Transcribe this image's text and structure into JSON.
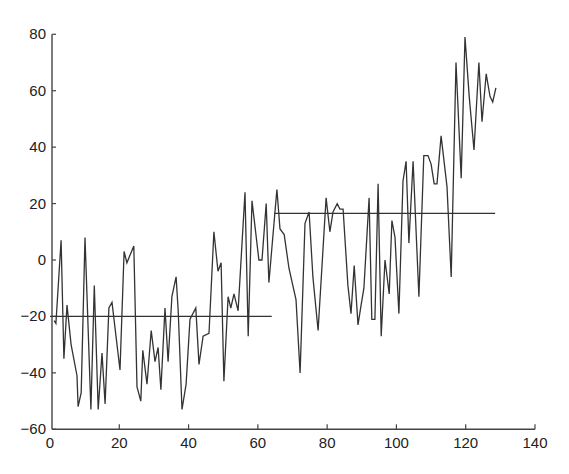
{
  "chart_data": {
    "type": "line",
    "title": "",
    "xlabel": "",
    "ylabel": "",
    "xlim": [
      0,
      140
    ],
    "ylim": [
      -60,
      80
    ],
    "x_ticks": [
      0,
      20,
      40,
      60,
      80,
      100,
      120,
      140
    ],
    "y_ticks": [
      -60,
      -40,
      -20,
      0,
      20,
      40,
      60,
      80
    ],
    "grid": false,
    "legend": null,
    "series": [
      {
        "name": "series",
        "color": "#333333",
        "points": [
          [
            1.2,
            -21.5
          ],
          [
            1.7,
            -22.5
          ],
          [
            3.2,
            7
          ],
          [
            4.0,
            -35
          ],
          [
            4.9,
            -16
          ],
          [
            6.1,
            -30
          ],
          [
            7.8,
            -41
          ],
          [
            8.1,
            -52
          ],
          [
            9.0,
            -47
          ],
          [
            10.1,
            8
          ],
          [
            11.8,
            -53
          ],
          [
            12.8,
            -9
          ],
          [
            13.9,
            -53
          ],
          [
            15.0,
            -33
          ],
          [
            15.9,
            -51
          ],
          [
            17.0,
            -17
          ],
          [
            17.9,
            -15
          ],
          [
            20.2,
            -39
          ],
          [
            21.4,
            3
          ],
          [
            22.2,
            -1
          ],
          [
            24.2,
            5
          ],
          [
            25.1,
            -45
          ],
          [
            26.2,
            -50
          ],
          [
            26.8,
            -32
          ],
          [
            28.0,
            -44
          ],
          [
            29.2,
            -25
          ],
          [
            30.3,
            -36
          ],
          [
            31.2,
            -31
          ],
          [
            32.0,
            -46
          ],
          [
            33.2,
            -17
          ],
          [
            34.1,
            -36
          ],
          [
            35.2,
            -13
          ],
          [
            36.4,
            -6
          ],
          [
            37.0,
            -18
          ],
          [
            38.1,
            -53
          ],
          [
            39.3,
            -44
          ],
          [
            40.4,
            -21
          ],
          [
            42.1,
            -17
          ],
          [
            43.0,
            -37
          ],
          [
            44.2,
            -27
          ],
          [
            45.9,
            -26
          ],
          [
            47.3,
            10
          ],
          [
            48.5,
            -4
          ],
          [
            49.4,
            -1
          ],
          [
            50.2,
            -43
          ],
          [
            51.4,
            -13
          ],
          [
            52.2,
            -17
          ],
          [
            53.1,
            -12
          ],
          [
            54.3,
            -18
          ],
          [
            56.3,
            24
          ],
          [
            57.2,
            -27
          ],
          [
            58.3,
            21
          ],
          [
            60.3,
            0
          ],
          [
            61.2,
            0
          ],
          [
            62.4,
            20
          ],
          [
            63.2,
            -8
          ],
          [
            65.5,
            25
          ],
          [
            66.4,
            11
          ],
          [
            67.6,
            9
          ],
          [
            69.0,
            -3
          ],
          [
            71.0,
            -14
          ],
          [
            72.2,
            -40
          ],
          [
            73.6,
            13
          ],
          [
            74.8,
            17
          ],
          [
            75.9,
            -6
          ],
          [
            77.4,
            -25
          ],
          [
            79.7,
            22
          ],
          [
            80.8,
            10
          ],
          [
            81.7,
            17
          ],
          [
            82.9,
            20
          ],
          [
            83.7,
            18
          ],
          [
            84.6,
            18
          ],
          [
            86.0,
            -9
          ],
          [
            86.9,
            -19
          ],
          [
            87.8,
            -2
          ],
          [
            88.9,
            -23
          ],
          [
            89.8,
            -16
          ],
          [
            90.6,
            -10
          ],
          [
            92.1,
            22
          ],
          [
            92.9,
            -21
          ],
          [
            93.8,
            -21
          ],
          [
            94.7,
            27
          ],
          [
            95.6,
            -27
          ],
          [
            96.7,
            0
          ],
          [
            97.9,
            -12
          ],
          [
            98.7,
            14
          ],
          [
            99.6,
            8
          ],
          [
            100.7,
            -19
          ],
          [
            101.9,
            28
          ],
          [
            102.8,
            35
          ],
          [
            103.6,
            6
          ],
          [
            104.8,
            35
          ],
          [
            106.5,
            -13
          ],
          [
            107.9,
            37
          ],
          [
            109.1,
            37
          ],
          [
            110.0,
            34
          ],
          [
            110.9,
            27
          ],
          [
            111.7,
            27
          ],
          [
            112.9,
            44
          ],
          [
            114.6,
            26
          ],
          [
            115.8,
            -6
          ],
          [
            117.2,
            70
          ],
          [
            118.7,
            29
          ],
          [
            119.8,
            79
          ],
          [
            121.0,
            58
          ],
          [
            122.4,
            39
          ],
          [
            123.8,
            70
          ],
          [
            124.7,
            49
          ],
          [
            125.9,
            66
          ],
          [
            127.0,
            58
          ],
          [
            127.8,
            56
          ],
          [
            128.7,
            61
          ]
        ]
      }
    ],
    "reference_lines": [
      {
        "name": "mean-segment-1",
        "x": [
          0,
          64
        ],
        "y": -20
      },
      {
        "name": "mean-segment-2",
        "x": [
          64.7,
          128.5
        ],
        "y": 16.5
      }
    ]
  }
}
